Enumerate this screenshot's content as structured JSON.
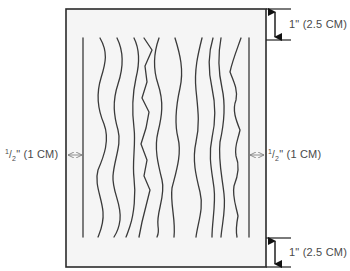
{
  "diagram": {
    "frame": {
      "x": 66,
      "y": 9,
      "width": 200,
      "height": 258,
      "stroke": "#333333",
      "fill": "#f4f4f4"
    },
    "margins": {
      "top": {
        "label": "1\" (2.5 CM)"
      },
      "bottom": {
        "label": "1\" (2.5 CM)"
      },
      "left": {
        "label_num": "1",
        "label_den": "2",
        "label_rest": "\" (1 CM)"
      },
      "right": {
        "label_num": "1",
        "label_den": "2",
        "label_rest": "\" (1 CM)"
      }
    },
    "lines": {
      "count": 11,
      "straight_left_x": 83,
      "straight_right_x": 249,
      "top_y": 40,
      "bottom_y": 237,
      "stroke": "#3a3a3a"
    }
  }
}
